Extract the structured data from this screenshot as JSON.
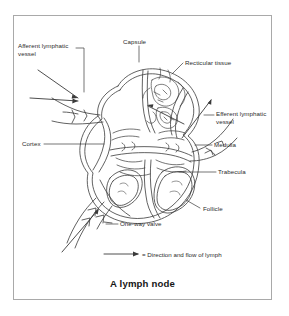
{
  "figure": {
    "caption": "A lymph node",
    "type": "anatomical-diagram",
    "frame_color": "#a9a9a9",
    "background_color": "#ffffff",
    "line_color": "#3a3a3a",
    "text_color": "#2b2b2b"
  },
  "labels": {
    "capsule": "Capsule",
    "afferent_lymphatic_vessel": "Afferent lymphatic vessel",
    "recticular_tissue": "Recticular tissue",
    "efferent_lymphatic_vessel": "Efferent lymphatic vessel",
    "cortex": "Cortex",
    "medulla": "Medulla",
    "trabecula": "Trabecula",
    "follicle": "Follicle",
    "one_way_valve": "One-way valve"
  },
  "legend": {
    "symbol": "arrow",
    "text": "= Direction and flow of lymph"
  }
}
